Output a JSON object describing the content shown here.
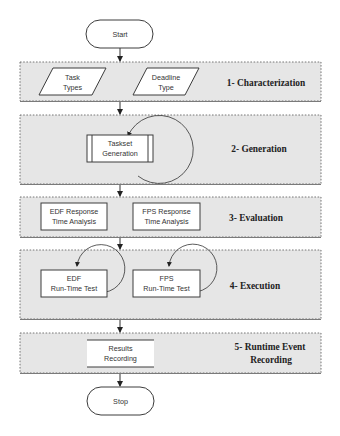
{
  "diagram": {
    "type": "flowchart",
    "start": {
      "label": "Start"
    },
    "stop": {
      "label": "Stop"
    },
    "stages": [
      {
        "label_lines": [
          "1- Characterization"
        ],
        "nodes": [
          {
            "id": "task-types",
            "shape": "parallelogram",
            "lines": [
              "Task",
              "Types"
            ]
          },
          {
            "id": "deadline-type",
            "shape": "parallelogram",
            "lines": [
              "Deadline",
              "Type"
            ]
          }
        ]
      },
      {
        "label_lines": [
          "2- Generation"
        ],
        "nodes": [
          {
            "id": "taskset-generation",
            "shape": "predefined-process",
            "lines": [
              "Taskset",
              "Generation"
            ],
            "self_loop": true
          }
        ]
      },
      {
        "label_lines": [
          "3- Evaluation"
        ],
        "nodes": [
          {
            "id": "edf-rta",
            "shape": "rectangle",
            "lines": [
              "EDF Response",
              "Time Analysis"
            ]
          },
          {
            "id": "fps-rta",
            "shape": "rectangle",
            "lines": [
              "FPS Response",
              "Time Analysis"
            ]
          }
        ]
      },
      {
        "label_lines": [
          "4- Execution"
        ],
        "nodes": [
          {
            "id": "edf-runtime-test",
            "shape": "rectangle",
            "lines": [
              "EDF",
              "Run-Time Test"
            ],
            "self_loop": true
          },
          {
            "id": "fps-runtime-test",
            "shape": "rectangle",
            "lines": [
              "FPS",
              "Run-Time Test"
            ],
            "self_loop": true
          }
        ]
      },
      {
        "label_lines": [
          "5- Runtime Event",
          "Recording"
        ],
        "nodes": [
          {
            "id": "results-recording",
            "shape": "data-store",
            "lines": [
              "Results",
              "Recording"
            ]
          }
        ]
      }
    ],
    "edges": [
      [
        "Start",
        "1- Characterization"
      ],
      [
        "1- Characterization",
        "2- Generation"
      ],
      [
        "2- Generation",
        "3- Evaluation"
      ],
      [
        "3- Evaluation",
        "4- Execution"
      ],
      [
        "4- Execution",
        "5- Runtime Event Recording"
      ],
      [
        "5- Runtime Event Recording",
        "Stop"
      ]
    ]
  }
}
